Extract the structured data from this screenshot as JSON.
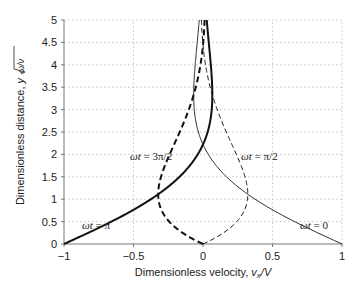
{
  "chart_data": {
    "type": "line",
    "title": "",
    "xlabel": "Dimensionless velocity, v_x/V",
    "ylabel": "Dimensionless distance, y√(ω/ν)",
    "xlim": [
      -1,
      1
    ],
    "ylim": [
      0,
      5
    ],
    "x_ticks": [
      "−1",
      "−0.5",
      "0",
      "0.5",
      "1"
    ],
    "y_ticks": [
      "0",
      "0.5",
      "1",
      "1.5",
      "2",
      "2.5",
      "3",
      "3.5",
      "4",
      "4.5",
      "5"
    ],
    "grid": true,
    "legend": "none (inline annotations)",
    "y": [
      0,
      0.25,
      0.5,
      0.75,
      1.0,
      1.25,
      1.5,
      1.75,
      2.0,
      2.25,
      2.5,
      2.75,
      3.0,
      3.5,
      4.0,
      4.5,
      5.0
    ],
    "series": [
      {
        "name": "ωt = 0",
        "style": "solid-thin",
        "x": [
          1.0,
          0.825,
          0.659,
          0.507,
          0.375,
          0.262,
          0.169,
          0.095,
          0.038,
          -0.004,
          -0.033,
          -0.052,
          -0.063,
          -0.066,
          -0.056,
          -0.041,
          -0.027
        ]
      },
      {
        "name": "ωt = π/2",
        "style": "dashed-thin",
        "x": [
          0.0,
          0.147,
          0.243,
          0.297,
          0.32,
          0.319,
          0.302,
          0.274,
          0.24,
          0.204,
          0.168,
          0.133,
          0.102,
          0.052,
          0.018,
          -0.002,
          -0.011
        ]
      },
      {
        "name": "ωt = π",
        "style": "solid-thick",
        "x": [
          -1.0,
          -0.825,
          -0.659,
          -0.507,
          -0.375,
          -0.262,
          -0.169,
          -0.095,
          -0.038,
          0.004,
          0.033,
          0.052,
          0.063,
          0.066,
          0.056,
          0.041,
          0.027
        ]
      },
      {
        "name": "ωt = 3π/2",
        "style": "dashed-thick",
        "x": [
          0.0,
          -0.147,
          -0.243,
          -0.297,
          -0.32,
          -0.319,
          -0.302,
          -0.274,
          -0.24,
          -0.204,
          -0.168,
          -0.133,
          -0.102,
          -0.052,
          -0.018,
          0.002,
          0.011
        ]
      }
    ],
    "annotations": [
      {
        "text": "ωt = 3π/2",
        "x": -0.48,
        "y": 1.85
      },
      {
        "text": "ωt = π/2",
        "x": 0.28,
        "y": 1.85
      },
      {
        "text": "ωt = π",
        "x": -0.78,
        "y": 0.62
      },
      {
        "text": "ωt = 0",
        "x": 0.66,
        "y": 0.62
      }
    ]
  },
  "labels": {
    "xlabel_main": "Dimensionless velocity, ",
    "xlabel_var": "v",
    "xlabel_sub": "x",
    "xlabel_tail": "/V",
    "ylabel_main": "Dimensionless distance, ",
    "ylabel_var": "y",
    "ylabel_root": "ω/ν",
    "annot_3pi2": "ωt = 3π/2",
    "annot_pi2": "ωt = π/2",
    "annot_pi": "ωt = π",
    "annot_0": "ωt = 0"
  }
}
